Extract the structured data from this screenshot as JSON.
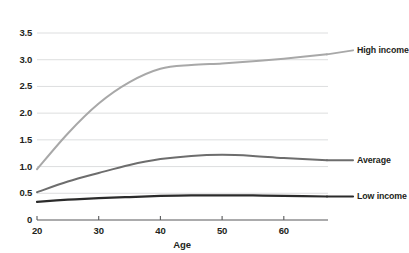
{
  "chart_data": {
    "type": "line",
    "title": "",
    "xlabel": "Age",
    "ylabel": "",
    "xlim": [
      20,
      67
    ],
    "ylim": [
      0,
      3.5
    ],
    "grid": true,
    "legend_position": "right-inline-end-of-line",
    "xticks": [
      20,
      30,
      40,
      50,
      60
    ],
    "xtick_labels": [
      "20",
      "30",
      "40",
      "50",
      "60"
    ],
    "yticks": [
      0,
      0.5,
      1.0,
      1.5,
      2.0,
      2.5,
      3.0,
      3.5
    ],
    "ytick_labels": [
      "0",
      "0.5",
      "1.0",
      "1.5",
      "2.0",
      "2.5",
      "3.0",
      "3.5"
    ],
    "x": [
      20,
      25,
      30,
      35,
      40,
      45,
      50,
      55,
      60,
      67
    ],
    "series": [
      {
        "name": "High income",
        "label": "High income",
        "color": "#a8a8a8",
        "width": 2.0,
        "values": [
          0.95,
          1.62,
          2.18,
          2.58,
          2.83,
          2.9,
          2.93,
          2.97,
          3.02,
          3.1
        ]
      },
      {
        "name": "Average",
        "label": "Average",
        "color": "#6d6d6d",
        "width": 2.0,
        "values": [
          0.52,
          0.72,
          0.88,
          1.03,
          1.14,
          1.2,
          1.22,
          1.2,
          1.16,
          1.12
        ]
      },
      {
        "name": "Low income",
        "label": "Low income",
        "color": "#2b2b2b",
        "width": 2.2,
        "values": [
          0.34,
          0.38,
          0.41,
          0.43,
          0.45,
          0.46,
          0.46,
          0.46,
          0.45,
          0.44
        ]
      }
    ]
  },
  "colors": {
    "axis": "#58595b",
    "grid": "#d9dadb",
    "text": "#231f20",
    "background": "#ffffff"
  }
}
